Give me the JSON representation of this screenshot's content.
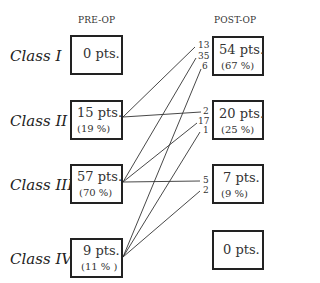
{
  "headers": {
    "pre": "PRE-OP",
    "post": "POST-OP"
  },
  "classes": [
    {
      "label": "Class I",
      "pre_pts": "0 pts.",
      "pre_pct": ""
    },
    {
      "label": "Class II",
      "pre_pts": "15 pts.",
      "pre_pct": "(19 %)"
    },
    {
      "label": "Class III",
      "pre_pts": "57 pts.",
      "pre_pct": "(70 %)"
    },
    {
      "label": "Class IV",
      "pre_pts": "9 pts.",
      "pre_pct": "(11 % )"
    }
  ],
  "post": [
    {
      "pts": "54 pts.",
      "pct": "(67 %)"
    },
    {
      "pts": "20 pts.",
      "pct": "(25 %)"
    },
    {
      "pts": "7 pts.",
      "pct": "(9 %)"
    },
    {
      "pts": "0 pts.",
      "pct": ""
    }
  ],
  "transitions": [
    {
      "from": "Class II",
      "to": "Class I",
      "count": "13"
    },
    {
      "from": "Class III",
      "to": "Class I",
      "count": "35"
    },
    {
      "from": "Class IV",
      "to": "Class I",
      "count": "6"
    },
    {
      "from": "Class II",
      "to": "Class II",
      "count": "2"
    },
    {
      "from": "Class III",
      "to": "Class II",
      "count": "17"
    },
    {
      "from": "Class IV",
      "to": "Class II",
      "count": "1"
    },
    {
      "from": "Class III",
      "to": "Class III",
      "count": "5"
    },
    {
      "from": "Class IV",
      "to": "Class III",
      "count": "2"
    }
  ]
}
